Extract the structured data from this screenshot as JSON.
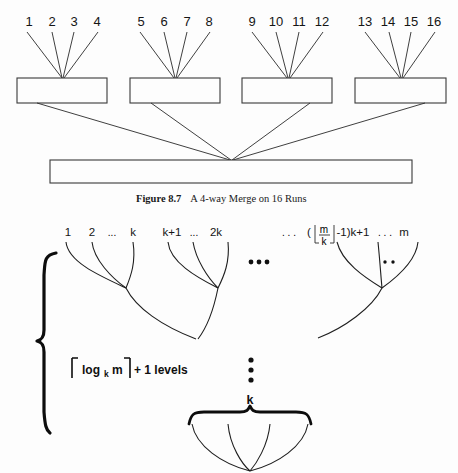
{
  "page": {
    "width": 458,
    "height": 473,
    "background": "#fdfdfd",
    "ink_color": "#1a1a1a"
  },
  "figure_top": {
    "name": "four-way-merge-diagram",
    "caption_label": "Figure  8.7",
    "caption_text": "A 4-way Merge on 16 Runs",
    "run_labels": [
      "1",
      "2",
      "3",
      "4",
      "5",
      "6",
      "7",
      "8",
      "9",
      "10",
      "11",
      "12",
      "13",
      "14",
      "15",
      "16"
    ],
    "groups": [
      {
        "runs": [
          "1",
          "2",
          "3",
          "4"
        ]
      },
      {
        "runs": [
          "5",
          "6",
          "7",
          "8"
        ]
      },
      {
        "runs": [
          "9",
          "10",
          "11",
          "12"
        ]
      },
      {
        "runs": [
          "13",
          "14",
          "15",
          "16"
        ]
      }
    ],
    "intermediate_buffer_count": 4,
    "final_buffer_count": 1,
    "merge_order": 4,
    "run_count": 16
  },
  "figure_bottom": {
    "name": "k-way-merge-tree-diagram",
    "group_labels": {
      "first": {
        "start": "1",
        "second": "2",
        "ellipsis": "...",
        "end": "k"
      },
      "second": {
        "start": "k+1",
        "ellipsis": "...",
        "end": "2k"
      },
      "last": {
        "leading_ellipsis": ". . .",
        "open_paren": "(",
        "floor_open": "⌊",
        "numerator": "m",
        "denominator": "k",
        "floor_close": "⌋",
        "minus_one": "-1)k+1",
        "trailing_ellipsis": ". . .",
        "end": "m"
      }
    },
    "group_separator": "•••",
    "inner_dots": "∙ ∙",
    "vertical_ellipsis_dots": 3,
    "levels_annotation": {
      "ceil_open": "⌈",
      "log_base_text": "log",
      "log_subscript": "k",
      "log_argument": "m",
      "ceil_close": "⌉",
      "suffix": "+ 1 levels"
    },
    "bottom_brace_label": "k",
    "branching_factor_label": "k"
  }
}
